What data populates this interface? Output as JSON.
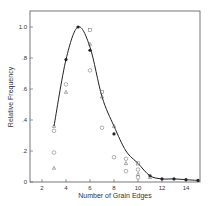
{
  "chart_data": {
    "type": "scatter",
    "title": "",
    "xlabel": "Number of Grain Edges",
    "ylabel": "Relative Frequency",
    "xlim": [
      1,
      15
    ],
    "ylim": [
      0,
      1.1
    ],
    "x_ticks": [
      2,
      4,
      6,
      8,
      10,
      12,
      14
    ],
    "x_tick_labels": [
      "2",
      "4",
      "6",
      "8",
      "10",
      "12",
      "14"
    ],
    "y_ticks": [
      0,
      0.2,
      0.4,
      0.6,
      0.8,
      1.0
    ],
    "y_tick_labels": [
      "0",
      ".2",
      ".4",
      ".6",
      ".8",
      "1.0"
    ],
    "grid": false,
    "legend": null,
    "series": [
      {
        "name": "fitted curve",
        "type": "line",
        "x": [
          3,
          4,
          5,
          6,
          7,
          8,
          9,
          10,
          11,
          12,
          13,
          14,
          15
        ],
        "y": [
          0.36,
          0.79,
          1.0,
          0.87,
          0.55,
          0.36,
          0.2,
          0.12,
          0.04,
          0.02,
          0.02,
          0.015,
          0.01
        ]
      },
      {
        "name": "filled points",
        "marker": "filled-circle",
        "x": [
          4,
          5,
          6,
          8,
          11,
          12,
          13,
          14,
          15
        ],
        "y": [
          0.79,
          1.0,
          0.85,
          0.31,
          0.04,
          0.02,
          0.02,
          0.015,
          0.01
        ]
      },
      {
        "name": "open circles",
        "marker": "circle",
        "x": [
          3,
          3,
          4,
          6,
          7,
          8,
          9,
          9,
          10,
          10
        ],
        "y": [
          0.33,
          0.19,
          0.63,
          0.72,
          0.35,
          0.16,
          0.15,
          0.07,
          0.08,
          0.03
        ]
      },
      {
        "name": "open squares",
        "marker": "square",
        "x": [
          6,
          7,
          10
        ],
        "y": [
          0.98,
          0.58,
          0.12
        ]
      },
      {
        "name": "triangles",
        "marker": "triangle",
        "x": [
          3,
          3,
          4,
          6,
          7,
          8,
          9,
          10,
          11
        ],
        "y": [
          0.36,
          0.09,
          0.58,
          0.89,
          0.55,
          0.36,
          0.12,
          0.05,
          0.03
        ]
      }
    ]
  }
}
